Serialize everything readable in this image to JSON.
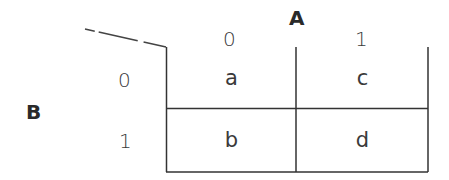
{
  "diagram": {
    "type": "karnaugh-map",
    "variables": {
      "column": "A",
      "row": "B"
    },
    "column_labels": [
      "0",
      "1"
    ],
    "row_labels": [
      "0",
      "1"
    ],
    "cells": [
      [
        "a",
        "c"
      ],
      [
        "b",
        "d"
      ]
    ]
  }
}
